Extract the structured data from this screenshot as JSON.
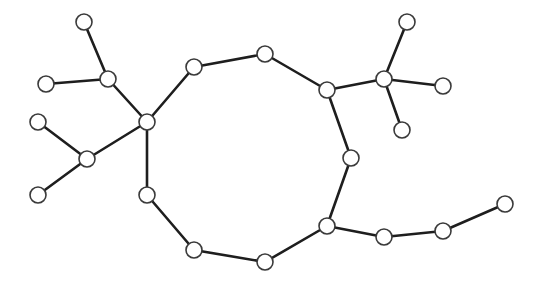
{
  "diagram": {
    "type": "graph",
    "style": {
      "background": "#ffffff",
      "edge_color": "#1e1e1e",
      "node_fill": "#ffffff",
      "node_stroke": "#3a3a3a",
      "node_radius": 8
    },
    "nodes": [
      {
        "id": "n1",
        "x": 84,
        "y": 22
      },
      {
        "id": "n2",
        "x": 108,
        "y": 79
      },
      {
        "id": "n3",
        "x": 46,
        "y": 84
      },
      {
        "id": "n4",
        "x": 147,
        "y": 122
      },
      {
        "id": "n5",
        "x": 38,
        "y": 122
      },
      {
        "id": "n6",
        "x": 87,
        "y": 159
      },
      {
        "id": "n7",
        "x": 38,
        "y": 195
      },
      {
        "id": "n8",
        "x": 194,
        "y": 67
      },
      {
        "id": "n9",
        "x": 265,
        "y": 54
      },
      {
        "id": "n10",
        "x": 327,
        "y": 90
      },
      {
        "id": "n11",
        "x": 384,
        "y": 79
      },
      {
        "id": "n12",
        "x": 407,
        "y": 22
      },
      {
        "id": "n13",
        "x": 443,
        "y": 86
      },
      {
        "id": "n14",
        "x": 402,
        "y": 130
      },
      {
        "id": "n15",
        "x": 351,
        "y": 158
      },
      {
        "id": "n16",
        "x": 327,
        "y": 226
      },
      {
        "id": "n17",
        "x": 147,
        "y": 195
      },
      {
        "id": "n18",
        "x": 194,
        "y": 250
      },
      {
        "id": "n19",
        "x": 265,
        "y": 262
      },
      {
        "id": "n20",
        "x": 384,
        "y": 237
      },
      {
        "id": "n21",
        "x": 443,
        "y": 231
      },
      {
        "id": "n22",
        "x": 505,
        "y": 204
      }
    ],
    "edges": [
      [
        "n1",
        "n2"
      ],
      [
        "n3",
        "n2"
      ],
      [
        "n2",
        "n4"
      ],
      [
        "n5",
        "n6"
      ],
      [
        "n6",
        "n7"
      ],
      [
        "n6",
        "n4"
      ],
      [
        "n4",
        "n8"
      ],
      [
        "n8",
        "n9"
      ],
      [
        "n9",
        "n10"
      ],
      [
        "n10",
        "n11"
      ],
      [
        "n11",
        "n12"
      ],
      [
        "n11",
        "n13"
      ],
      [
        "n11",
        "n14"
      ],
      [
        "n10",
        "n15"
      ],
      [
        "n15",
        "n16"
      ],
      [
        "n4",
        "n17"
      ],
      [
        "n17",
        "n18"
      ],
      [
        "n18",
        "n19"
      ],
      [
        "n19",
        "n16"
      ],
      [
        "n16",
        "n20"
      ],
      [
        "n20",
        "n21"
      ],
      [
        "n21",
        "n22"
      ]
    ]
  }
}
